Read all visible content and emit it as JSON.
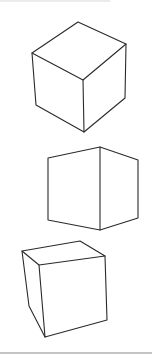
{
  "figure": {
    "colors": {
      "line": "#2a2a2a",
      "background": "#ffffff",
      "rule": "#9a9a9a",
      "top_rule": "#d0d0d0"
    },
    "cubes": [
      {
        "name": "top-cube",
        "orientation": "viewed from above, corner facing",
        "vertices": {
          "top": [
            78,
            22
          ],
          "left": [
            32,
            53
          ],
          "right": [
            126,
            44
          ],
          "center": [
            83,
            80
          ],
          "bottom_left": [
            36,
            105
          ],
          "bottom": [
            84,
            132
          ],
          "bottom_right": [
            125,
            98
          ]
        }
      },
      {
        "name": "middle-cube",
        "orientation": "eye level, vertical edge facing",
        "vertices": {
          "top_left": [
            48,
            158
          ],
          "top_mid": [
            100,
            147
          ],
          "top_right": [
            138,
            160
          ],
          "bottom_left": [
            48,
            220
          ],
          "bottom_mid": [
            100,
            230
          ],
          "bottom_right": [
            138,
            218
          ]
        }
      },
      {
        "name": "bottom-cube",
        "orientation": "viewed from above, face facing",
        "vertices": {
          "back_left": [
            22,
            251
          ],
          "back_right": [
            80,
            241
          ],
          "front_right": [
            105,
            256
          ],
          "front_left": [
            39,
            265
          ],
          "bottom_back_left": [
            29,
            306
          ],
          "bottom_front_left": [
            45,
            337
          ],
          "bottom_front_right": [
            107,
            320
          ]
        }
      }
    ],
    "rules": {
      "bottom_y": 353,
      "top_y": 1
    }
  }
}
